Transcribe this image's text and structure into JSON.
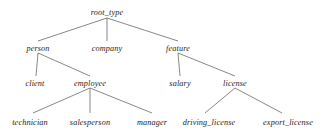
{
  "diagram": {
    "kind": "taxonomy-tree",
    "background_color": "#ffffff",
    "edge_color": "#555555",
    "text_color": "#1c1c1c",
    "nodes": {
      "root_type": {
        "label": "root_type",
        "x": 107,
        "y": 8,
        "level": 0
      },
      "person": {
        "label": "person",
        "x": 38,
        "y": 44,
        "level": 1
      },
      "company": {
        "label": "company",
        "x": 107,
        "y": 44,
        "level": 1
      },
      "feature": {
        "label": "feature",
        "x": 178,
        "y": 44,
        "level": 1
      },
      "client": {
        "label": "client",
        "x": 35,
        "y": 79,
        "level": 2
      },
      "employee": {
        "label": "employee",
        "x": 90,
        "y": 79,
        "level": 2
      },
      "salary": {
        "label": "salary",
        "x": 180,
        "y": 79,
        "level": 2
      },
      "license": {
        "label": "license",
        "x": 235,
        "y": 79,
        "level": 2
      },
      "technician": {
        "label": "technician",
        "x": 30,
        "y": 118,
        "level": 3
      },
      "salesperson": {
        "label": "salesperson",
        "x": 90,
        "y": 118,
        "level": 3
      },
      "manager": {
        "label": "manager",
        "x": 152,
        "y": 118,
        "level": 3
      },
      "driving_license": {
        "label": "driving_license",
        "x": 209,
        "y": 118,
        "level": 3
      },
      "export_license": {
        "label": "export_license",
        "x": 288,
        "y": 118,
        "level": 3
      }
    },
    "edges": [
      {
        "from": "root_type",
        "to": "person"
      },
      {
        "from": "root_type",
        "to": "company"
      },
      {
        "from": "root_type",
        "to": "feature"
      },
      {
        "from": "person",
        "to": "client"
      },
      {
        "from": "person",
        "to": "employee"
      },
      {
        "from": "feature",
        "to": "salary"
      },
      {
        "from": "feature",
        "to": "license"
      },
      {
        "from": "employee",
        "to": "technician"
      },
      {
        "from": "employee",
        "to": "salesperson"
      },
      {
        "from": "employee",
        "to": "manager"
      },
      {
        "from": "license",
        "to": "driving_license"
      },
      {
        "from": "license",
        "to": "export_license"
      }
    ]
  }
}
